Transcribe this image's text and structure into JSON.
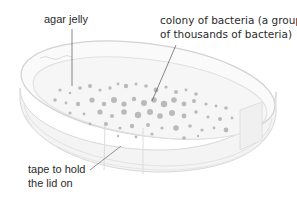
{
  "diagram": {
    "labels": {
      "agar": {
        "line1": "agar jelly"
      },
      "colony": {
        "line1": "colony of bacteria (a group",
        "line2": "of thousands of bacteria)"
      },
      "tape": {
        "line1": "tape to hold",
        "line2": "the lid on"
      }
    },
    "colors": {
      "text": "#2b2b2b",
      "dish_outline": "#d6d6d6",
      "dish_fill": "#f7f7f7",
      "colony": "#a9a9a9",
      "leader_line": "#555555"
    }
  }
}
